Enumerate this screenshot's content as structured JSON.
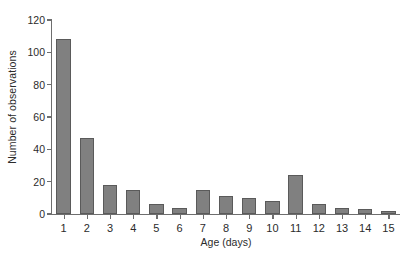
{
  "chart_data": {
    "type": "bar",
    "title": "",
    "xlabel": "Age (days)",
    "ylabel": "Number of observations",
    "categories": [
      "1",
      "2",
      "3",
      "4",
      "5",
      "6",
      "7",
      "8",
      "9",
      "10",
      "11",
      "12",
      "13",
      "14",
      "15"
    ],
    "values": [
      108,
      47,
      18,
      15,
      6,
      4,
      15,
      11,
      10,
      8,
      24,
      6,
      4,
      3,
      2
    ],
    "ylim": [
      0,
      120
    ],
    "yticks": [
      0,
      20,
      40,
      60,
      80,
      100,
      120
    ],
    "ytick_labels": [
      "0",
      "20",
      "40",
      "60",
      "80",
      "100",
      "120"
    ],
    "grid": false,
    "legend": false,
    "bar_color": "#808080",
    "bar_edge_color": "#5a5a5a",
    "axis_color": "#6e6e6e",
    "text_color": "#2b2b2b",
    "background": "#ffffff"
  }
}
